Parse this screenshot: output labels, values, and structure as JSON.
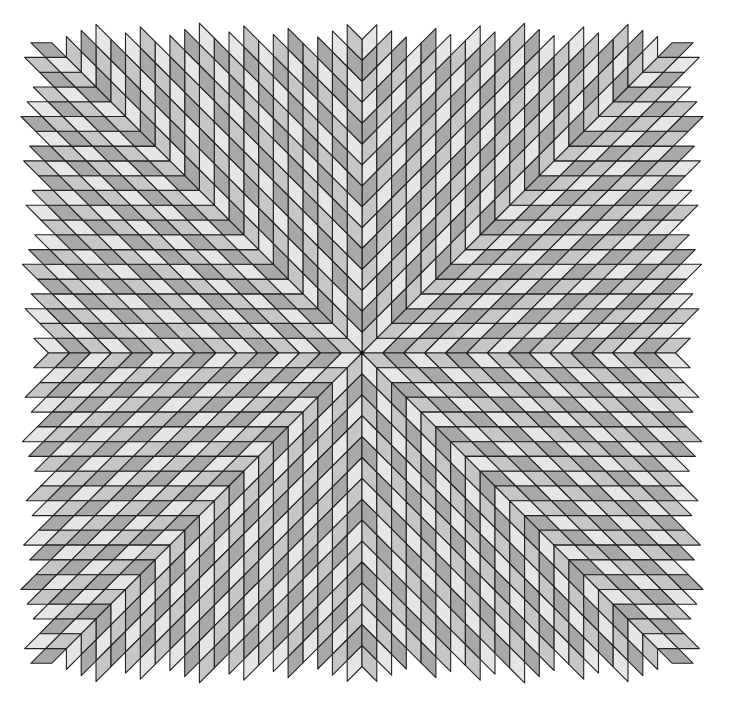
{
  "figure": {
    "symmetry": 8,
    "rhombus_angle_deg": 45,
    "center": [
      362,
      353
    ],
    "edge_length": 20.9,
    "clip_half_width": 341,
    "clip_half_height": 330,
    "colors": {
      "light": "#e6e6e6",
      "medium": "#c6c6c6",
      "dark": "#a8a8a8",
      "stroke": "#222222",
      "background": "#ffffff"
    }
  }
}
